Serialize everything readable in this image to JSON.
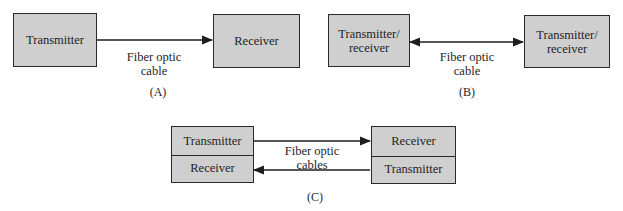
{
  "panels": {
    "a": {
      "caption": "(A)",
      "left_box": "Transmitter",
      "right_box": "Receiver",
      "cable_label_line1": "Fiber optic",
      "cable_label_line2": "cable",
      "arrow": "one-way right"
    },
    "b": {
      "caption": "(B)",
      "left_box_line1": "Transmitter/",
      "left_box_line2": "receiver",
      "right_box_line1": "Transmitter/",
      "right_box_line2": "receiver",
      "cable_label_line1": "Fiber optic",
      "cable_label_line2": "cable",
      "arrow": "bidirectional"
    },
    "c": {
      "caption": "(C)",
      "left_top": "Transmitter",
      "left_bottom": "Receiver",
      "right_top": "Receiver",
      "right_bottom": "Transmitter",
      "cable_label_line1": "Fiber optic",
      "cable_label_line2": "cables",
      "arrows": [
        "top: left to right",
        "bottom: right to left"
      ]
    }
  },
  "colors": {
    "box_fill": "#cfcfcf",
    "stroke": "#2a2a2a",
    "text": "#1e1e1e",
    "background": "#ffffff"
  }
}
